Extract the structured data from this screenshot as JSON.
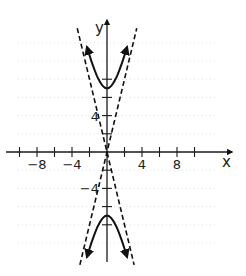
{
  "chart_data": {
    "type": "line",
    "title": "",
    "xlabel": "x",
    "ylabel": "y",
    "xlim": [
      -11,
      14
    ],
    "ylim": [
      -12,
      14
    ],
    "x_ticks": [
      -10,
      -8,
      -6,
      -4,
      -2,
      2,
      4,
      6,
      8,
      10
    ],
    "y_ticks": [
      -8,
      -6,
      -4,
      -2,
      2,
      4,
      6,
      8
    ],
    "x_tick_labels": [
      {
        "value": -8,
        "text": "−8"
      },
      {
        "value": -4,
        "text": "−4"
      },
      {
        "value": 4,
        "text": "4"
      },
      {
        "value": 8,
        "text": "8"
      }
    ],
    "y_tick_labels": [
      {
        "value": 4,
        "text": "4"
      },
      {
        "value": -4,
        "text": "−4"
      }
    ],
    "grid": true,
    "series": [
      {
        "name": "hyperbola-upper-branch",
        "style": "solid-with-arrows",
        "equation": "y^2/49 - x^2/3 = 1, y > 0",
        "a": 7,
        "b": 1.75,
        "x_range": [
          -2.3,
          2.3
        ]
      },
      {
        "name": "hyperbola-lower-branch",
        "style": "solid-with-arrows",
        "equation": "y^2/49 - x^2/3 = 1, y < 0",
        "a": 7,
        "b": 1.75,
        "x_range": [
          -2.3,
          2.3
        ]
      },
      {
        "name": "asymptote-positive",
        "style": "dashed",
        "equation": "y = 4x",
        "slope": 4,
        "x_range": [
          -3.1,
          3.4
        ]
      },
      {
        "name": "asymptote-negative",
        "style": "dashed",
        "equation": "y = -4x",
        "slope": -4,
        "x_range": [
          -3.4,
          3.1
        ]
      }
    ]
  }
}
